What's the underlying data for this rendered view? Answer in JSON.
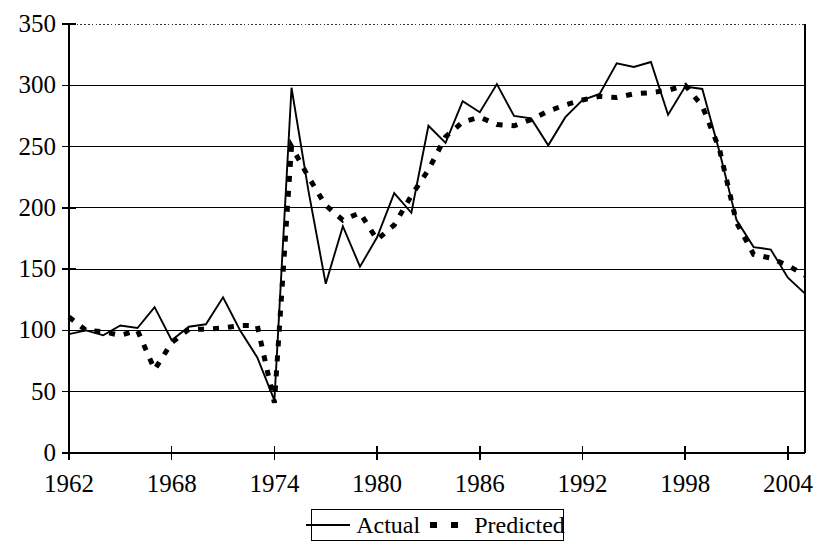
{
  "chart_data": {
    "type": "line",
    "title": "",
    "xlabel": "",
    "ylabel": "",
    "xlim": [
      1962,
      2005
    ],
    "ylim": [
      0,
      350
    ],
    "grid": true,
    "grid_axis": "y",
    "legend_position": "bottom-center",
    "x_ticks": [
      "1962",
      "1968",
      "1974",
      "1980",
      "1986",
      "1992",
      "1998",
      "2004"
    ],
    "x_tick_values": [
      1962,
      1968,
      1974,
      1980,
      1986,
      1992,
      1998,
      2004
    ],
    "y_ticks": [
      "0",
      "50",
      "100",
      "150",
      "200",
      "250",
      "300",
      "350"
    ],
    "y_tick_values": [
      0,
      50,
      100,
      150,
      200,
      250,
      300,
      350
    ],
    "x": [
      1962,
      1963,
      1964,
      1965,
      1966,
      1967,
      1968,
      1969,
      1970,
      1971,
      1972,
      1973,
      1974,
      1975,
      1976,
      1977,
      1978,
      1979,
      1980,
      1981,
      1982,
      1983,
      1984,
      1985,
      1986,
      1987,
      1988,
      1989,
      1990,
      1991,
      1992,
      1993,
      1994,
      1995,
      1996,
      1997,
      1998,
      1999,
      2000,
      2001,
      2002,
      2003,
      2004,
      2005
    ],
    "series": [
      {
        "name": "Actual",
        "style": "solid",
        "values": [
          97,
          100,
          96,
          104,
          102,
          119,
          92,
          103,
          105,
          127,
          100,
          78,
          43,
          298,
          213,
          138,
          185,
          152,
          176,
          212,
          196,
          267,
          253,
          287,
          278,
          301,
          275,
          273,
          251,
          274,
          288,
          293,
          318,
          315,
          319,
          276,
          299,
          297,
          246,
          190,
          168,
          166,
          143,
          130
        ]
      },
      {
        "name": "Predicted",
        "style": "dotted",
        "values": [
          111,
          100,
          99,
          96,
          100,
          68,
          90,
          101,
          101,
          102,
          104,
          104,
          41,
          250,
          225,
          202,
          190,
          196,
          174,
          186,
          210,
          231,
          258,
          270,
          274,
          268,
          267,
          272,
          279,
          284,
          288,
          291,
          290,
          293,
          294,
          296,
          300,
          283,
          248,
          188,
          162,
          159,
          153,
          145
        ]
      }
    ]
  },
  "legend": {
    "entries": [
      {
        "label": "Actual",
        "style": "solid"
      },
      {
        "label": "Predicted",
        "style": "dotted"
      }
    ]
  }
}
